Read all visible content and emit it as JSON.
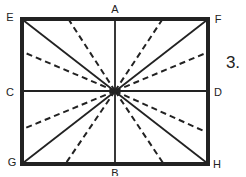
{
  "figure": {
    "step_number": "3.",
    "colors": {
      "stroke": "#222222",
      "background": "#ffffff"
    },
    "labels": {
      "A": "A",
      "B": "B",
      "C": "C",
      "D": "D",
      "E": "E",
      "F": "F",
      "G": "G",
      "H": "H"
    },
    "lines": {
      "solid": [
        "EH diagonal",
        "FG diagonal",
        "AB vertical",
        "CD horizontal"
      ],
      "dashed_count": 8
    }
  }
}
